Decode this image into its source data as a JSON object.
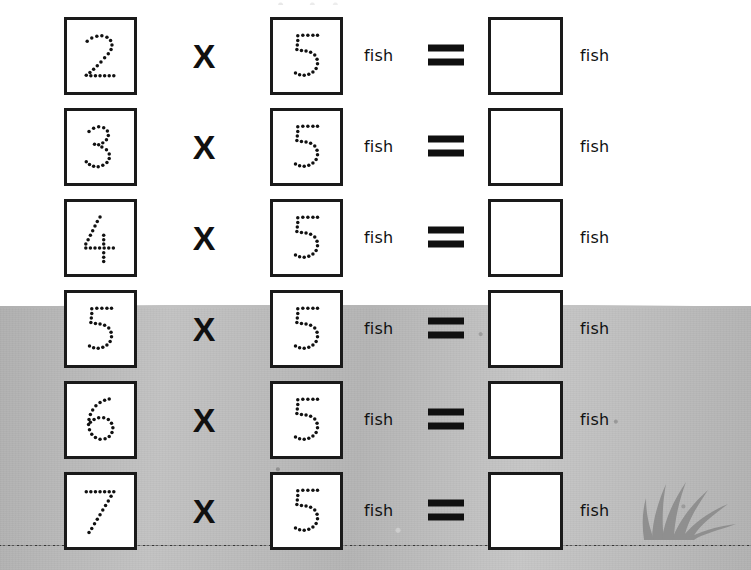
{
  "worksheet": {
    "operator_symbol": "X",
    "equals_symbol": "=",
    "unit_label": "fish",
    "answer_placeholder": "",
    "multiplier": "5",
    "colors": {
      "ink": "#111111",
      "box_border": "#1a1a1a",
      "paper": "#ffffff",
      "ground_gray": "#b8b8b8",
      "soil_dark": "#6e6e6e",
      "grass_gray": "#8f8f8f"
    },
    "rows": [
      {
        "factor_a": "2",
        "factor_b": "5",
        "operator": "X",
        "unit_a": "fish",
        "equals": "=",
        "answer": "",
        "unit_b": "fish"
      },
      {
        "factor_a": "3",
        "factor_b": "5",
        "operator": "X",
        "unit_a": "fish",
        "equals": "=",
        "answer": "",
        "unit_b": "fish"
      },
      {
        "factor_a": "4",
        "factor_b": "5",
        "operator": "X",
        "unit_a": "fish",
        "equals": "=",
        "answer": "",
        "unit_b": "fish"
      },
      {
        "factor_a": "5",
        "factor_b": "5",
        "operator": "X",
        "unit_a": "fish",
        "equals": "=",
        "answer": "",
        "unit_b": "fish"
      },
      {
        "factor_a": "6",
        "factor_b": "5",
        "operator": "X",
        "unit_a": "fish",
        "equals": "=",
        "answer": "",
        "unit_b": "fish"
      },
      {
        "factor_a": "7",
        "factor_b": "5",
        "operator": "X",
        "unit_a": "fish",
        "equals": "=",
        "answer": "",
        "unit_b": "fish"
      }
    ]
  }
}
